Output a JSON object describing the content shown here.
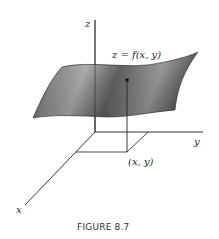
{
  "figure": {
    "caption": "FIGURE 8.7",
    "surface_label": "z = f(x, y)",
    "point_label": "(x, y)",
    "axes": {
      "x": "x",
      "y": "y",
      "z": "z"
    }
  },
  "colors": {
    "surface_dark": "#3a3a3a",
    "surface_mid": "#8a8a8a",
    "surface_light": "#cfcfcf",
    "line": "#333333"
  }
}
